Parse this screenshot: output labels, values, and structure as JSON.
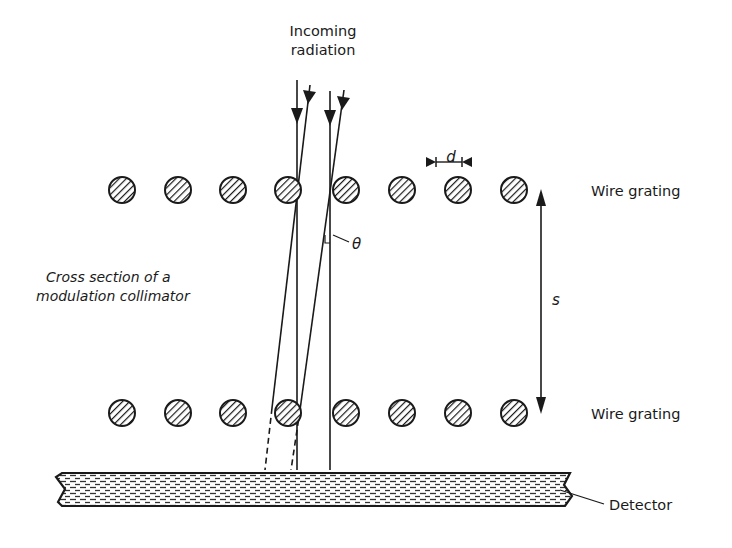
{
  "title": "Cross section of a modulation collimator",
  "labels": {
    "incoming_line1": "Incoming",
    "incoming_line2": "radiation",
    "wire_grating_top": "Wire grating",
    "wire_grating_bottom": "Wire grating",
    "cross_section_line1": "Cross section of a",
    "cross_section_line2": "modulation collimator",
    "spacing_symbol": "d",
    "separation_symbol": "s",
    "angle_symbol": "θ",
    "detector": "Detector"
  },
  "gratings": {
    "wire_count_per_row": 8,
    "top_row_y": 190,
    "bottom_row_y": 413,
    "wire_x": [
      122,
      178,
      233,
      288,
      346,
      402,
      458,
      514
    ],
    "wire_radius": 13
  },
  "colors": {
    "ink": "#1a1a1a",
    "background": "#ffffff"
  }
}
